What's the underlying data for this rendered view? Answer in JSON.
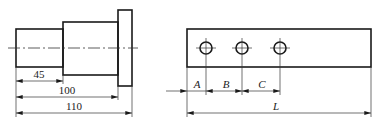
{
  "colors": {
    "line": "#1a1a1a",
    "thin": "#333333",
    "background": "#ffffff"
  },
  "shaft": {
    "title": "stepped-shaft",
    "dimensions": [
      {
        "label": "45",
        "value": 45
      },
      {
        "label": "100",
        "value": 100
      },
      {
        "label": "110",
        "value": 110
      }
    ]
  },
  "plate": {
    "title": "plate-with-holes",
    "hole_count": 3,
    "dimensions": [
      {
        "label": "A"
      },
      {
        "label": "B"
      },
      {
        "label": "C"
      },
      {
        "label": "L"
      }
    ]
  }
}
